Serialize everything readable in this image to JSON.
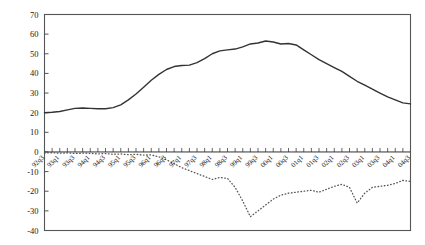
{
  "chart_data": {
    "type": "line",
    "title": "",
    "subtitle": "",
    "xlabel": "",
    "ylabel": "",
    "ylim": [
      -40,
      70
    ],
    "ytick_values": [
      -40,
      -30,
      -20,
      -10,
      0,
      10,
      20,
      30,
      40,
      50,
      60,
      70
    ],
    "ytick_labels": [
      "-40",
      "-30",
      "-20",
      "-10",
      "0",
      "10",
      "20",
      "30",
      "40",
      "50",
      "60",
      "70"
    ],
    "grid": false,
    "legend": "none",
    "zero_line": true,
    "categories": [
      "92q3",
      "92q4",
      "93q1",
      "93q2",
      "93q3",
      "93q4",
      "94q1",
      "94q2",
      "94q3",
      "94q4",
      "95q1",
      "95q2",
      "95q3",
      "95q4",
      "96q1",
      "96q2",
      "96q3",
      "96q4",
      "97q1",
      "97q2",
      "97q3",
      "97q4",
      "98q1",
      "98q2",
      "98q3",
      "98q4",
      "99q1",
      "99q2",
      "99q3",
      "99q4",
      "00q1",
      "00q2",
      "00q3",
      "00q4",
      "01q1",
      "01q2",
      "01q3",
      "01q4",
      "02q1",
      "02q2",
      "02q3",
      "02q4",
      "03q1",
      "03q2",
      "03q3",
      "03q4",
      "04q1",
      "04q2",
      "04q3"
    ],
    "xtick_labels": [
      "92q3",
      "93q1",
      "93q3",
      "94q1",
      "94q3",
      "95q1",
      "95q3",
      "96q1",
      "96q3",
      "97q1",
      "97q3",
      "98q1",
      "98q3",
      "99q1",
      "99q3",
      "00q1",
      "00q3",
      "01q1",
      "01q3",
      "02q1",
      "02q3",
      "03q1",
      "03q3",
      "04q1",
      "04q3"
    ],
    "series": [
      {
        "name": "solid-series",
        "style": "solid",
        "color": "#333333",
        "values": [
          20.0,
          20.2,
          20.6,
          21.4,
          22.2,
          22.4,
          22.2,
          22.0,
          22.0,
          22.6,
          24.0,
          26.5,
          29.5,
          33.0,
          36.5,
          39.5,
          42.0,
          43.5,
          44.0,
          44.2,
          45.5,
          47.5,
          50.0,
          51.5,
          52.0,
          52.4,
          53.5,
          55.0,
          55.5,
          56.5,
          56.0,
          55.0,
          55.2,
          54.5,
          52.0,
          49.5,
          47.0,
          45.0,
          43.0,
          41.0,
          38.5,
          36.0,
          34.0,
          32.0,
          30.0,
          28.0,
          26.5,
          25.0,
          24.5
        ]
      },
      {
        "name": "dotted-series",
        "style": "dotted",
        "color": "#555555",
        "values": [
          -0.5,
          -0.4,
          -0.6,
          -0.5,
          -0.8,
          -0.6,
          -0.7,
          -1.0,
          -0.8,
          -1.2,
          -1.0,
          -1.4,
          -1.2,
          -1.6,
          -1.5,
          -2.5,
          -4.0,
          -6.0,
          -8.0,
          -9.5,
          -11.0,
          -12.5,
          -14.0,
          -13.0,
          -13.5,
          -18.0,
          -25.0,
          -33.0,
          -30.0,
          -27.0,
          -24.0,
          -22.0,
          -21.0,
          -20.5,
          -20.0,
          -19.5,
          -20.5,
          -19.0,
          -17.5,
          -16.5,
          -18.0,
          -26.0,
          -21.0,
          -18.0,
          -17.5,
          -17.0,
          -16.0,
          -14.5,
          -15.0
        ]
      }
    ]
  }
}
